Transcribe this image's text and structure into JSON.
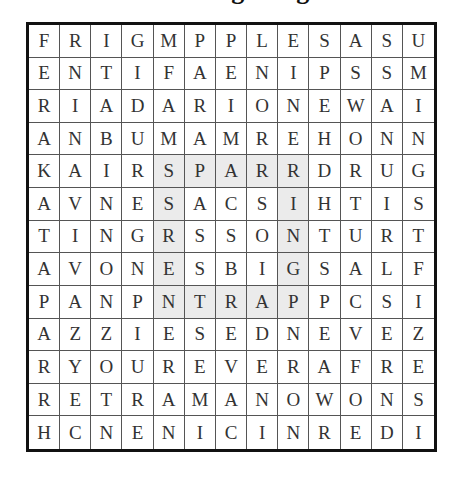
{
  "title": "Finding Ring",
  "grid": {
    "rows": 13,
    "cols": 13,
    "letters": [
      [
        "F",
        "R",
        "I",
        "G",
        "M",
        "P",
        "P",
        "L",
        "E",
        "S",
        "A",
        "S",
        "U"
      ],
      [
        "E",
        "N",
        "T",
        "I",
        "F",
        "A",
        "E",
        "N",
        "I",
        "P",
        "S",
        "S",
        "M"
      ],
      [
        "R",
        "I",
        "A",
        "D",
        "A",
        "R",
        "I",
        "O",
        "N",
        "E",
        "W",
        "A",
        "I"
      ],
      [
        "A",
        "N",
        "B",
        "U",
        "M",
        "A",
        "M",
        "R",
        "E",
        "H",
        "O",
        "N",
        "N"
      ],
      [
        "K",
        "A",
        "I",
        "R",
        "S",
        "P",
        "A",
        "R",
        "R",
        "D",
        "R",
        "U",
        "G"
      ],
      [
        "A",
        "V",
        "N",
        "E",
        "S",
        "A",
        "C",
        "S",
        "I",
        "H",
        "T",
        "I",
        "S"
      ],
      [
        "T",
        "I",
        "N",
        "G",
        "R",
        "S",
        "S",
        "O",
        "N",
        "T",
        "U",
        "R",
        "T"
      ],
      [
        "A",
        "V",
        "O",
        "N",
        "E",
        "S",
        "B",
        "I",
        "G",
        "S",
        "A",
        "L",
        "F"
      ],
      [
        "P",
        "A",
        "N",
        "P",
        "N",
        "T",
        "R",
        "A",
        "P",
        "P",
        "C",
        "S",
        "I"
      ],
      [
        "A",
        "Z",
        "Z",
        "I",
        "E",
        "S",
        "E",
        "D",
        "N",
        "E",
        "V",
        "E",
        "Z"
      ],
      [
        "R",
        "Y",
        "O",
        "U",
        "R",
        "E",
        "V",
        "E",
        "R",
        "A",
        "F",
        "R",
        "E"
      ],
      [
        "R",
        "E",
        "T",
        "R",
        "A",
        "M",
        "A",
        "N",
        "O",
        "W",
        "O",
        "N",
        "S"
      ],
      [
        "H",
        "C",
        "N",
        "E",
        "N",
        "I",
        "C",
        "I",
        "N",
        "R",
        "E",
        "D",
        "I"
      ]
    ],
    "highlighted_cells": [
      [
        4,
        4
      ],
      [
        4,
        5
      ],
      [
        4,
        6
      ],
      [
        4,
        7
      ],
      [
        4,
        8
      ],
      [
        5,
        4
      ],
      [
        6,
        4
      ],
      [
        7,
        4
      ],
      [
        8,
        4
      ],
      [
        5,
        8
      ],
      [
        6,
        8
      ],
      [
        7,
        8
      ],
      [
        8,
        8
      ],
      [
        8,
        5
      ],
      [
        8,
        6
      ],
      [
        8,
        7
      ]
    ],
    "highlight_color": "#ebebeb"
  }
}
